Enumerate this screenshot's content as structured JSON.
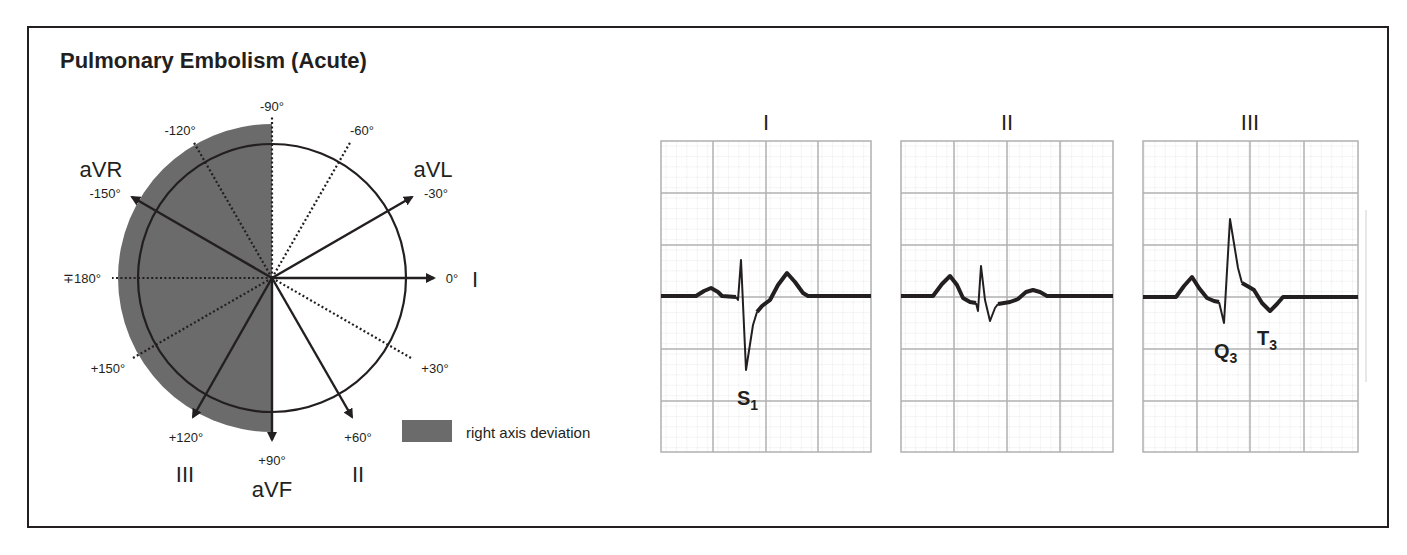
{
  "title": "Pulmonary Embolism (Acute)",
  "colors": {
    "ink": "#231f20",
    "shade": "#6b6b6b",
    "grid_major": "#b0b0b0",
    "grid_minor": "#d4d4d4"
  },
  "hexaxial": {
    "angle_labels": {
      "m90": "-90°",
      "m120": "-120°",
      "m60": "-60°",
      "m150": "-150°",
      "m30": "-30°",
      "p180": "∓180°",
      "zero": "0°",
      "p150": "+150°",
      "p30": "+30°",
      "p120": "+120°",
      "p90": "+90°",
      "p60": "+60°"
    },
    "lead_labels": {
      "aVR": "aVR",
      "aVL": "aVL",
      "I": "I",
      "II": "II",
      "III": "III",
      "aVF": "aVF"
    },
    "legend": {
      "label": "right axis deviation"
    }
  },
  "ecg": {
    "panels": [
      {
        "lead": "I",
        "annotation_main": "S",
        "annotation_sub": "1"
      },
      {
        "lead": "II"
      },
      {
        "lead": "III",
        "annotations": [
          {
            "main": "Q",
            "sub": "3"
          },
          {
            "main": "T",
            "sub": "3"
          }
        ]
      }
    ]
  }
}
